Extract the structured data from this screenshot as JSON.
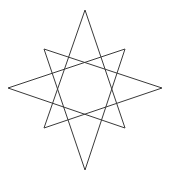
{
  "figure": {
    "background_color": "#ffffff",
    "stroke_color": "#3a3a3a",
    "stroke_width": 1,
    "fill": "none",
    "canvas": {
      "width": 172,
      "height": 180
    },
    "center": {
      "x": 85,
      "y": 90
    },
    "point_count": 8,
    "step": 3,
    "schlafli_symbol": "{8/3}",
    "closed_path": true
  },
  "chart_data": {
    "type": "line",
    "xlabel": "",
    "ylabel": "",
    "xlim": [
      0,
      172
    ],
    "ylim": [
      180,
      0
    ],
    "grid": false,
    "legend": "none",
    "vertices": [
      {
        "name": "top",
        "angle_deg": 270,
        "x": 85,
        "y": 10
      },
      {
        "name": "upper-right",
        "angle_deg": 315,
        "x": 125,
        "y": 49
      },
      {
        "name": "right",
        "angle_deg": 0,
        "x": 162,
        "y": 88
      },
      {
        "name": "lower-right",
        "angle_deg": 45,
        "x": 125,
        "y": 128
      },
      {
        "name": "bottom",
        "angle_deg": 90,
        "x": 85,
        "y": 170
      },
      {
        "name": "lower-left",
        "angle_deg": 135,
        "x": 44,
        "y": 128
      },
      {
        "name": "left",
        "angle_deg": 180,
        "x": 8,
        "y": 88
      },
      {
        "name": "upper-left",
        "angle_deg": 225,
        "x": 44,
        "y": 49
      }
    ],
    "draw_order": [
      0,
      3,
      6,
      1,
      4,
      7,
      2,
      5,
      0
    ],
    "path_points": [
      {
        "x": 85,
        "y": 10
      },
      {
        "x": 125,
        "y": 128
      },
      {
        "x": 8,
        "y": 88
      },
      {
        "x": 125,
        "y": 49
      },
      {
        "x": 85,
        "y": 170
      },
      {
        "x": 44,
        "y": 49
      },
      {
        "x": 162,
        "y": 88
      },
      {
        "x": 44,
        "y": 128
      },
      {
        "x": 85,
        "y": 10
      }
    ],
    "inner_octagon_bounds": {
      "x_min": 64,
      "x_max": 106,
      "y_min": 68,
      "y_max": 110
    }
  }
}
